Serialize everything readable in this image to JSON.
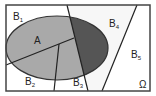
{
  "diagram": {
    "type": "partition-venn",
    "universe_label": "Ω",
    "event_label": "A",
    "partitions": [
      {
        "name": "B",
        "index": "1"
      },
      {
        "name": "B",
        "index": "2"
      },
      {
        "name": "B",
        "index": "3"
      },
      {
        "name": "B",
        "index": "4"
      },
      {
        "name": "B",
        "index": "5"
      }
    ],
    "colors": {
      "border": "#444444",
      "ellipse_light": "#a9a9a9",
      "ellipse_dark": "#555555",
      "background": "#ffffff",
      "b4_region": "#f7f7f7"
    }
  }
}
